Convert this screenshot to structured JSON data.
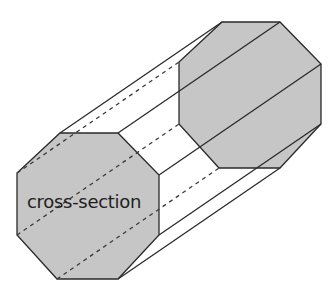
{
  "diagram": {
    "label": "cross-section",
    "colors": {
      "background": "#ffffff",
      "face_fill": "#c6c6c6",
      "stroke": "#2a2a2a",
      "text": "#1e1e1e"
    },
    "front_face": [
      [
        60,
        133
      ],
      [
        118,
        133
      ],
      [
        159,
        175
      ],
      [
        159,
        235
      ],
      [
        118,
        279
      ],
      [
        57,
        279
      ],
      [
        17,
        235
      ],
      [
        17,
        173
      ]
    ],
    "back_face": [
      [
        222,
        22
      ],
      [
        280,
        22
      ],
      [
        321,
        64
      ],
      [
        321,
        124
      ],
      [
        280,
        168
      ],
      [
        219,
        168
      ],
      [
        179,
        124
      ],
      [
        179,
        62
      ]
    ],
    "visible_lateral_edges": [
      [
        [
          60,
          133
        ],
        [
          222,
          22
        ]
      ],
      [
        [
          118,
          133
        ],
        [
          280,
          22
        ]
      ],
      [
        [
          159,
          175
        ],
        [
          321,
          64
        ]
      ],
      [
        [
          159,
          235
        ],
        [
          321,
          124
        ]
      ],
      [
        [
          118,
          279
        ],
        [
          280,
          168
        ]
      ]
    ],
    "hidden_lateral_edges": [
      [
        [
          17,
          173
        ],
        [
          179,
          62
        ]
      ],
      [
        [
          17,
          235
        ],
        [
          179,
          124
        ]
      ],
      [
        [
          57,
          279
        ],
        [
          219,
          168
        ]
      ]
    ]
  }
}
